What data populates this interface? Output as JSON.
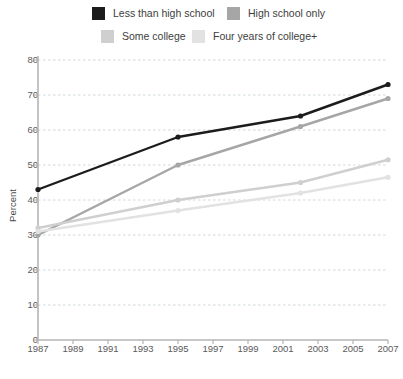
{
  "legend": {
    "items": [
      {
        "label": "Less than high school",
        "color": "#1c1c1c",
        "swatch_name": "legend-swatch-less-than-high-school"
      },
      {
        "label": "High school only",
        "color": "#a6a6a6",
        "swatch_name": "legend-swatch-high-school-only"
      },
      {
        "label": "Some college",
        "color": "#cfcfcf",
        "swatch_name": "legend-swatch-some-college"
      },
      {
        "label": "Four years of college+",
        "color": "#e2e2e2",
        "swatch_name": "legend-swatch-four-years-of-college"
      }
    ]
  },
  "chart_data": {
    "type": "line",
    "title": "",
    "xlabel": "",
    "ylabel": "Percent",
    "xlim": [
      1987,
      2007
    ],
    "ylim": [
      0,
      80
    ],
    "grid": true,
    "legend_position": "top",
    "x_ticks": [
      1987,
      1989,
      1991,
      1993,
      1995,
      1997,
      1999,
      2001,
      2003,
      2005,
      2007
    ],
    "y_ticks": [
      0,
      10,
      20,
      30,
      40,
      50,
      60,
      70,
      80
    ],
    "x": [
      1987,
      1995,
      2002,
      2007
    ],
    "series": [
      {
        "name": "Less than high school",
        "color": "#1c1c1c",
        "width": 2.4,
        "marker": true,
        "values": [
          43,
          58,
          64,
          73
        ]
      },
      {
        "name": "High school only",
        "color": "#a6a6a6",
        "width": 2.4,
        "marker": true,
        "values": [
          30,
          50,
          61,
          69
        ]
      },
      {
        "name": "Some college",
        "color": "#cfcfcf",
        "width": 2.4,
        "marker": true,
        "values": [
          32,
          40,
          45,
          51.5
        ]
      },
      {
        "name": "Four years of college+",
        "color": "#e2e2e2",
        "width": 2.4,
        "marker": true,
        "values": [
          31,
          37,
          42,
          46.5
        ]
      }
    ]
  },
  "axes": {
    "y_label": "Percent",
    "y_tick_labels": [
      "80",
      "70",
      "60",
      "50",
      "40",
      "30",
      "20",
      "10",
      "0"
    ],
    "x_tick_labels": [
      "1987",
      "1989",
      "1991",
      "1993",
      "1995",
      "1997",
      "1999",
      "2001",
      "2003",
      "2005",
      "2007"
    ]
  },
  "style": {
    "background": "#ffffff",
    "axis_color": "#b5b5b5",
    "grid_color": "#cfd8dc",
    "tick_text_color": "#5a5a5a"
  }
}
